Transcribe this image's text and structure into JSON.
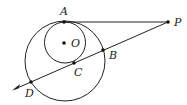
{
  "diagram": {
    "type": "geometry",
    "points": {
      "A": {
        "label": "A",
        "x": 64,
        "y": 22
      },
      "P": {
        "label": "P",
        "x": 168,
        "y": 22
      },
      "O": {
        "label": "O",
        "x": 64,
        "y": 43
      },
      "B": {
        "label": "B",
        "x": 103,
        "y": 50
      },
      "C": {
        "label": "C",
        "x": 74,
        "y": 63
      },
      "D": {
        "label": "D",
        "x": 31,
        "y": 82
      }
    },
    "circles": [
      {
        "name": "small",
        "cx": 65,
        "cy": 42,
        "r": 21
      },
      {
        "name": "large",
        "cx": 65,
        "cy": 61,
        "r": 40
      }
    ],
    "labels": {
      "A": "A",
      "P": "P",
      "O": "O",
      "B": "B",
      "C": "C",
      "D": "D"
    }
  }
}
